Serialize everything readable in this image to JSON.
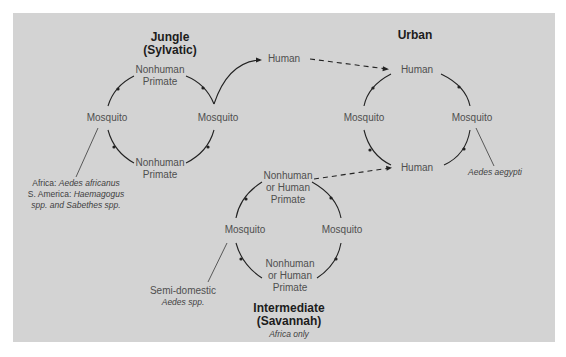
{
  "diagram": {
    "type": "transmission-cycles",
    "colors": {
      "background": "#ffffff",
      "panel": "#d3d3d3",
      "label": "#4f4f4f",
      "title": "#1c1c1c",
      "line": "#222222"
    },
    "jungle": {
      "title_line1": "Jungle",
      "title_line2": "(Sylvatic)",
      "top_host_line1": "Nonhuman",
      "top_host_line2": "Primate",
      "left_vector": "Mosquito",
      "right_vector": "Mosquito",
      "bottom_host_line1": "Nonhuman",
      "bottom_host_line2": "Primate",
      "note_line1_prefix": "Africa: ",
      "note_line1_species": "Aedes africanus",
      "note_line2_prefix": "S. America: ",
      "note_line2_species": "Haemagogus",
      "note_line3": "spp. and Sabethes spp."
    },
    "bridge_human": "Human",
    "urban": {
      "title": "Urban",
      "top_host": "Human",
      "left_vector": "Mosquito",
      "right_vector": "Mosquito",
      "bottom_host": "Human",
      "note": "Aedes aegypti"
    },
    "intermediate": {
      "title_line1": "Intermediate",
      "title_line2": "(Savannah)",
      "subtitle": "Africa only",
      "top_host_line1": "Nonhuman",
      "top_host_line2": "or Human",
      "top_host_line3": "Primate",
      "left_vector": "Mosquito",
      "right_vector": "Mosquito",
      "bottom_host_line1": "Nonhuman",
      "bottom_host_line2": "or Human",
      "bottom_host_line3": "Primate",
      "note_line1": "Semi-domestic",
      "note_line2": "Aedes spp."
    }
  }
}
